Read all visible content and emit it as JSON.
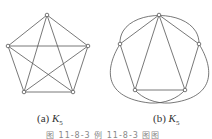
{
  "figure_a": {
    "label_prefix": "(a) ",
    "label_var": "K",
    "label_sub": "5",
    "vertices": [
      [
        47,
        15
      ],
      [
        8,
        46
      ],
      [
        88,
        46
      ],
      [
        24,
        92
      ],
      [
        73,
        92
      ]
    ],
    "edges": [
      [
        0,
        1
      ],
      [
        0,
        2
      ],
      [
        0,
        3
      ],
      [
        0,
        4
      ],
      [
        1,
        2
      ],
      [
        1,
        3
      ],
      [
        1,
        4
      ],
      [
        2,
        3
      ],
      [
        2,
        4
      ],
      [
        3,
        4
      ]
    ]
  },
  "figure_b": {
    "label_prefix": "(b) ",
    "label_var": "K",
    "label_sub": "5",
    "vertices": [
      [
        159,
        15
      ],
      [
        120,
        44
      ],
      [
        199,
        44
      ],
      [
        135,
        90
      ],
      [
        185,
        90
      ]
    ]
  },
  "caption": "图 11-8-3   例 11-8-3 图图",
  "colors": {
    "line": "#555555",
    "vertex_fill": "#ffffff"
  }
}
